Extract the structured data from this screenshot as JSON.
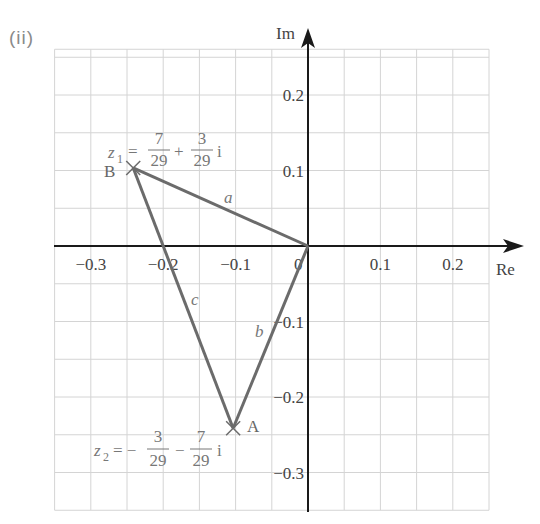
{
  "part_label": "(ii)",
  "axes": {
    "x_label": "Re",
    "y_label": "Im",
    "origin_label": "0",
    "x_ticks": [
      {
        "value": -0.3,
        "label": "−0.3"
      },
      {
        "value": -0.2,
        "label": "−0.2"
      },
      {
        "value": -0.1,
        "label": "−0.1"
      },
      {
        "value": 0.1,
        "label": "0.1"
      },
      {
        "value": 0.2,
        "label": "0.2"
      }
    ],
    "y_ticks": [
      {
        "value": 0.2,
        "label": "0.2"
      },
      {
        "value": 0.1,
        "label": "0.1"
      },
      {
        "value": -0.1,
        "label": "−0.1"
      },
      {
        "value": -0.2,
        "label": "−0.2"
      },
      {
        "value": -0.3,
        "label": "−0.3"
      }
    ],
    "grid_step": 0.05,
    "x_range": [
      -0.35,
      0.25
    ],
    "y_range": [
      -0.35,
      0.25
    ]
  },
  "points": {
    "B": {
      "label": "B",
      "re": -0.2414,
      "im": 0.1034,
      "equation": {
        "lhs": "z",
        "sub": "1",
        "eq": "=",
        "frac1_num": "7",
        "frac1_den": "29",
        "op": "+",
        "frac2_num": "3",
        "frac2_den": "29",
        "unit": "i"
      }
    },
    "A": {
      "label": "A",
      "re": -0.1034,
      "im": -0.2414,
      "equation": {
        "lhs": "z",
        "sub": "2",
        "eq": "= −",
        "frac1_num": "3",
        "frac1_den": "29",
        "op": "−",
        "frac2_num": "7",
        "frac2_den": "29",
        "unit": "i"
      }
    },
    "O": {
      "re": 0,
      "im": 0
    }
  },
  "sides": {
    "a": "a",
    "b": "b",
    "c": "c"
  },
  "colors": {
    "grid": "#d4d4d4",
    "axis": "#1a1a1a",
    "triangle": "#6b6b6b",
    "label": "#666666"
  }
}
